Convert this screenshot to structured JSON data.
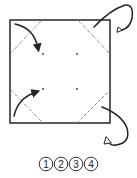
{
  "diagram": {
    "type": "origami-fold-diagram",
    "square": {
      "x": 10,
      "y": 20,
      "size": 100,
      "stroke": "#333333"
    },
    "center_points": [
      {
        "x": 43,
        "y": 53
      },
      {
        "x": 77,
        "y": 53
      },
      {
        "x": 43,
        "y": 89
      },
      {
        "x": 77,
        "y": 89
      }
    ],
    "fold_lines": [
      {
        "id": "top-left",
        "style": "dash-dot",
        "from": [
          10,
          53
        ],
        "to": [
          43,
          20
        ]
      },
      {
        "id": "top-right",
        "style": "dash-dot",
        "from": [
          77,
          20
        ],
        "to": [
          110,
          53
        ]
      },
      {
        "id": "bottom-left",
        "style": "dash-dot",
        "from": [
          10,
          89
        ],
        "to": [
          43,
          123
        ]
      },
      {
        "id": "bottom-right",
        "style": "dash",
        "from": [
          77,
          123
        ],
        "to": [
          110,
          89
        ]
      }
    ],
    "arrows": [
      {
        "id": "top-left",
        "kind": "valley-fold-front",
        "color": "#222222"
      },
      {
        "id": "bottom-left",
        "kind": "valley-fold-front",
        "color": "#222222"
      },
      {
        "id": "top-right",
        "kind": "fold-behind",
        "color": "#222222"
      },
      {
        "id": "bottom-right",
        "kind": "fold-behind",
        "color": "#222222"
      }
    ],
    "step_labels": [
      "1",
      "2",
      "3",
      "4"
    ]
  }
}
